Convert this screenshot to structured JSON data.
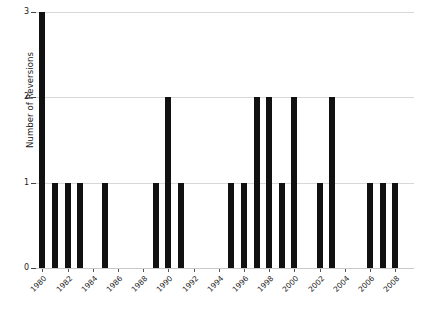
{
  "chart_data": {
    "type": "bar",
    "title": "",
    "xlabel": "",
    "ylabel": "Number of Reversions",
    "ylim": [
      0,
      3
    ],
    "y_ticks": [
      0,
      1,
      2,
      3
    ],
    "y_tick_labels": [
      "0",
      "1",
      "2",
      "3"
    ],
    "grid": true,
    "grid_axis": "y",
    "legend": false,
    "bar_color": "#111111",
    "grid_color": "#d8d8d8",
    "x_tick_rotation": -45,
    "x_tick_step": 2,
    "x_tick_labels": [
      "1980",
      "1982",
      "1984",
      "1986",
      "1988",
      "1990",
      "1992",
      "1994",
      "1996",
      "1998",
      "2000",
      "2002",
      "2004",
      "2006",
      "2008"
    ],
    "categories": [
      "1980",
      "1981",
      "1982",
      "1983",
      "1984",
      "1985",
      "1986",
      "1987",
      "1988",
      "1989",
      "1990",
      "1991",
      "1992",
      "1993",
      "1994",
      "1995",
      "1996",
      "1997",
      "1998",
      "1999",
      "2000",
      "2001",
      "2002",
      "2003",
      "2004",
      "2005",
      "2006",
      "2007",
      "2008",
      "2009"
    ],
    "values": [
      3,
      1,
      1,
      1,
      0,
      1,
      0,
      0,
      0,
      1,
      2,
      1,
      0,
      0,
      0,
      1,
      1,
      2,
      2,
      1,
      2,
      0,
      1,
      2,
      0,
      0,
      1,
      1,
      1,
      0
    ]
  }
}
